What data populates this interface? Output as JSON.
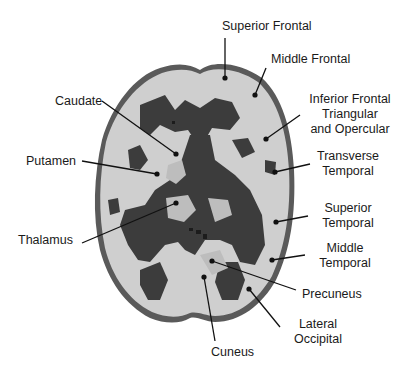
{
  "figure": {
    "colors": {
      "background": "#ffffff",
      "outline": "#5a5a5a",
      "dark_matter": "#3c3c3c",
      "light_matter": "#cfcfcf",
      "label_text": "#1a1a1a",
      "leader_line": "#111111"
    }
  },
  "labels": {
    "superior_frontal": "Superior Frontal",
    "middle_frontal": "Middle Frontal",
    "inferior_frontal_1": "Inferior Frontal",
    "inferior_frontal_2": "Triangular",
    "inferior_frontal_3": "and Opercular",
    "caudate": "Caudate",
    "putamen": "Putamen",
    "thalamus": "Thalamus",
    "transverse_temporal_1": "Transverse",
    "transverse_temporal_2": "Temporal",
    "superior_temporal_1": "Superior",
    "superior_temporal_2": "Temporal",
    "middle_temporal_1": "Middle",
    "middle_temporal_2": "Temporal",
    "precuneus": "Precuneus",
    "lateral_occipital_1": "Lateral",
    "lateral_occipital_2": "Occipital",
    "cuneus": "Cuneus"
  }
}
